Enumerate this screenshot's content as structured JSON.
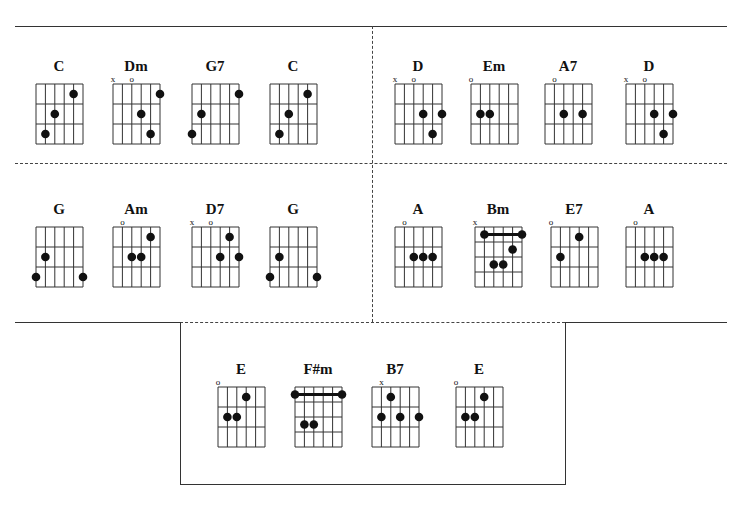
{
  "sections": [
    {
      "id": "row1-left",
      "chords": [
        {
          "name": "C",
          "x": 36,
          "y": 62,
          "frets": 3,
          "marks": [
            "",
            "",
            "",
            "",
            "",
            ""
          ],
          "dots": [
            [
              1,
              3
            ],
            [
              2,
              2
            ],
            [
              4,
              1
            ]
          ],
          "barre": null
        },
        {
          "name": "Dm",
          "x": 113,
          "y": 62,
          "frets": 3,
          "marks": [
            "x",
            "",
            "o",
            "",
            "",
            ""
          ],
          "dots": [
            [
              5,
              1
            ],
            [
              3,
              2
            ],
            [
              4,
              3
            ]
          ],
          "barre": null
        },
        {
          "name": "G7",
          "x": 192,
          "y": 62,
          "frets": 3,
          "marks": [
            "",
            "",
            "",
            "",
            "",
            ""
          ],
          "dots": [
            [
              0,
              3
            ],
            [
              1,
              2
            ],
            [
              5,
              1
            ]
          ],
          "barre": null
        },
        {
          "name": "C",
          "x": 270,
          "y": 62,
          "frets": 3,
          "marks": [
            "",
            "",
            "",
            "",
            "",
            ""
          ],
          "dots": [
            [
              1,
              3
            ],
            [
              2,
              2
            ],
            [
              4,
              1
            ]
          ],
          "barre": null
        }
      ]
    },
    {
      "id": "row1-right",
      "chords": [
        {
          "name": "D",
          "x": 395,
          "y": 62,
          "frets": 3,
          "marks": [
            "x",
            "",
            "o",
            "",
            "",
            ""
          ],
          "dots": [
            [
              3,
              2
            ],
            [
              5,
              2
            ],
            [
              4,
              3
            ]
          ],
          "barre": null
        },
        {
          "name": "Em",
          "x": 471,
          "y": 62,
          "frets": 3,
          "marks": [
            "o",
            "",
            "",
            "",
            "",
            ""
          ],
          "dots": [
            [
              1,
              2
            ],
            [
              2,
              2
            ]
          ],
          "barre": null
        },
        {
          "name": "A7",
          "x": 545,
          "y": 62,
          "frets": 3,
          "marks": [
            "",
            "o",
            "",
            "",
            "",
            ""
          ],
          "dots": [
            [
              2,
              2
            ],
            [
              4,
              2
            ]
          ],
          "barre": null
        },
        {
          "name": "D",
          "x": 626,
          "y": 62,
          "frets": 3,
          "marks": [
            "x",
            "",
            "o",
            "",
            "",
            ""
          ],
          "dots": [
            [
              3,
              2
            ],
            [
              5,
              2
            ],
            [
              4,
              3
            ]
          ],
          "barre": null
        }
      ]
    },
    {
      "id": "row2-left",
      "chords": [
        {
          "name": "G",
          "x": 36,
          "y": 205,
          "frets": 3,
          "marks": [
            "",
            "",
            "",
            "",
            "",
            ""
          ],
          "dots": [
            [
              1,
              2
            ],
            [
              0,
              3
            ],
            [
              5,
              3
            ]
          ],
          "barre": null
        },
        {
          "name": "Am",
          "x": 113,
          "y": 205,
          "frets": 3,
          "marks": [
            "",
            "o",
            "",
            "",
            "",
            ""
          ],
          "dots": [
            [
              4,
              1
            ],
            [
              2,
              2
            ],
            [
              3,
              2
            ]
          ],
          "barre": null
        },
        {
          "name": "D7",
          "x": 192,
          "y": 205,
          "frets": 3,
          "marks": [
            "x",
            "",
            "o",
            "",
            "",
            ""
          ],
          "dots": [
            [
              4,
              1
            ],
            [
              3,
              2
            ],
            [
              5,
              2
            ]
          ],
          "barre": null
        },
        {
          "name": "G",
          "x": 270,
          "y": 205,
          "frets": 3,
          "marks": [
            "",
            "",
            "",
            "",
            "",
            ""
          ],
          "dots": [
            [
              1,
              2
            ],
            [
              0,
              3
            ],
            [
              5,
              3
            ]
          ],
          "barre": null
        }
      ]
    },
    {
      "id": "row2-right",
      "chords": [
        {
          "name": "A",
          "x": 395,
          "y": 205,
          "frets": 3,
          "marks": [
            "",
            "o",
            "",
            "",
            "",
            ""
          ],
          "dots": [
            [
              2,
              2
            ],
            [
              3,
              2
            ],
            [
              4,
              2
            ]
          ],
          "barre": null
        },
        {
          "name": "Bm",
          "x": 475,
          "y": 205,
          "frets": 4,
          "marks": [
            "x",
            "",
            "",
            "",
            "",
            ""
          ],
          "dots": [
            [
              4,
              2
            ],
            [
              2,
              3
            ],
            [
              3,
              3
            ]
          ],
          "barre": {
            "fret": 1,
            "from": 1,
            "to": 5
          }
        },
        {
          "name": "E7",
          "x": 551,
          "y": 205,
          "frets": 3,
          "marks": [
            "o",
            "",
            "",
            "",
            "",
            ""
          ],
          "dots": [
            [
              1,
              2
            ],
            [
              3,
              1
            ]
          ],
          "barre": null
        },
        {
          "name": "A",
          "x": 626,
          "y": 205,
          "frets": 3,
          "marks": [
            "",
            "o",
            "",
            "",
            "",
            ""
          ],
          "dots": [
            [
              2,
              2
            ],
            [
              3,
              2
            ],
            [
              4,
              2
            ]
          ],
          "barre": null
        }
      ]
    },
    {
      "id": "row3",
      "chords": [
        {
          "name": "E",
          "x": 218,
          "y": 365,
          "frets": 3,
          "marks": [
            "o",
            "",
            "",
            "",
            "",
            ""
          ],
          "dots": [
            [
              3,
              1
            ],
            [
              1,
              2
            ],
            [
              2,
              2
            ]
          ],
          "barre": null
        },
        {
          "name": "F#m",
          "x": 295,
          "y": 365,
          "frets": 4,
          "marks": [
            "",
            "",
            "",
            "",
            "",
            ""
          ],
          "dots": [
            [
              1,
              3
            ],
            [
              2,
              3
            ]
          ],
          "barre": {
            "fret": 1,
            "from": 0,
            "to": 5
          }
        },
        {
          "name": "B7",
          "x": 372,
          "y": 365,
          "frets": 3,
          "marks": [
            "",
            "x",
            "",
            "",
            "",
            ""
          ],
          "dots": [
            [
              2,
              1
            ],
            [
              1,
              2
            ],
            [
              3,
              2
            ],
            [
              5,
              2
            ]
          ],
          "barre": null
        },
        {
          "name": "E",
          "x": 456,
          "y": 365,
          "frets": 3,
          "marks": [
            "o",
            "",
            "",
            "",
            "",
            ""
          ],
          "dots": [
            [
              3,
              1
            ],
            [
              1,
              2
            ],
            [
              2,
              2
            ]
          ],
          "barre": null
        }
      ]
    }
  ],
  "colors": {
    "ink": "#111111",
    "line": "#333333",
    "background": "#ffffff"
  }
}
